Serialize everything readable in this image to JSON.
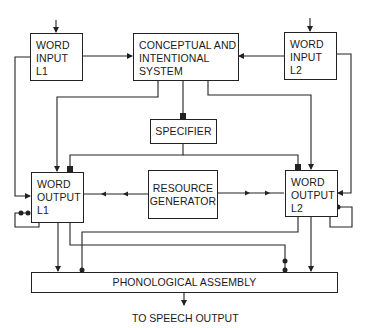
{
  "diagram": {
    "boxes": {
      "word_input_l1": {
        "line1": "WORD",
        "line2": "INPUT",
        "line3": "L1"
      },
      "conceptual": {
        "line1": "CONCEPTUAL AND",
        "line2": "INTENTIONAL",
        "line3": "SYSTEM"
      },
      "word_input_l2": {
        "line1": "WORD",
        "line2": "INPUT",
        "line3": "L2"
      },
      "specifier": {
        "label": "SPECIFIER"
      },
      "word_output_l1": {
        "line1": "WORD",
        "line2": "OUTPUT",
        "line3": "L1"
      },
      "resource_generator": {
        "line1": "RESOURCE",
        "line2": "GENERATOR"
      },
      "word_output_l2": {
        "line1": "WORD",
        "line2": "OUTPUT",
        "line3": "L2"
      },
      "phonological_assembly": {
        "label": "PHONOLOGICAL ASSEMBLY"
      }
    },
    "output_caption": "TO SPEECH OUTPUT",
    "colors": {
      "stroke": "#222222",
      "background": "#ffffff"
    }
  }
}
